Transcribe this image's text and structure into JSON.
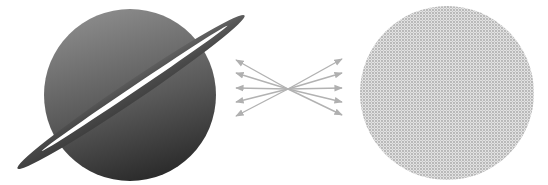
{
  "diagram": {
    "planet": {
      "label": "",
      "cx": 130,
      "cy": 95,
      "r": 86,
      "gradient_top": "#8a8a8a",
      "gradient_bottom": "#2e2e2e"
    },
    "ring": {
      "color_outer": "#555555",
      "color_inner": "#3a3a3a",
      "slit_color": "#ffffff",
      "angle_deg": -34
    },
    "arrows": {
      "count_each_side": 5,
      "color": "#b4b4b4",
      "center_x": 288,
      "center_y": 89
    },
    "halftone_circle": {
      "cx": 447,
      "cy": 93,
      "r": 87,
      "dot_color": "#a9a9a9",
      "bg_color": "#dcdcdc"
    }
  }
}
